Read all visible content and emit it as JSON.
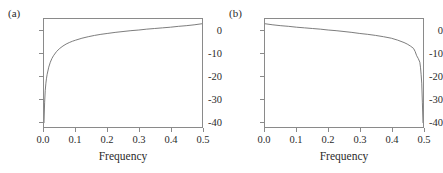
{
  "figure": {
    "background_color": "#ffffff",
    "axis_color": "#8a8a8a",
    "curve_color": "#6e6e6e",
    "text_color": "#2b2b2b"
  },
  "panels": [
    {
      "label": "(a)",
      "xlabel": "Frequency",
      "xticks": [
        "0.0",
        "0.1",
        "0.2",
        "0.3",
        "0.4",
        "0.5"
      ],
      "yticks": [
        "0",
        "-10",
        "-20",
        "-30",
        "-40"
      ]
    },
    {
      "label": "(b)",
      "xlabel": "Frequency",
      "xticks": [
        "0.0",
        "0.1",
        "0.2",
        "0.3",
        "0.4",
        "0.5"
      ],
      "yticks": [
        "0",
        "-10",
        "-20",
        "-30",
        "-40"
      ]
    }
  ],
  "chart_data": [
    {
      "type": "line",
      "title": "(a)",
      "xlabel": "Frequency",
      "ylabel": "",
      "xlim": [
        0.0,
        0.5
      ],
      "ylim": [
        -45,
        5
      ],
      "xticks": [
        0.0,
        0.1,
        0.2,
        0.3,
        0.4,
        0.5
      ],
      "yticks": [
        0,
        -10,
        -20,
        -30,
        -40
      ],
      "grid": false,
      "legend": "none",
      "series": [
        {
          "name": "spectrum-a",
          "x": [
            0.0,
            0.002,
            0.004,
            0.006,
            0.008,
            0.01,
            0.015,
            0.02,
            0.025,
            0.03,
            0.04,
            0.05,
            0.06,
            0.07,
            0.08,
            0.09,
            0.1,
            0.12,
            0.14,
            0.16,
            0.18,
            0.2,
            0.225,
            0.25,
            0.275,
            0.3,
            0.325,
            0.35,
            0.375,
            0.4,
            0.425,
            0.45,
            0.475,
            0.5
          ],
          "y": [
            -43.0,
            -33.5,
            -28.0,
            -24.7,
            -22.4,
            -20.6,
            -17.3,
            -15.0,
            -13.3,
            -12.0,
            -10.0,
            -8.6,
            -7.5,
            -6.6,
            -5.9,
            -5.3,
            -4.8,
            -3.9,
            -3.2,
            -2.6,
            -2.1,
            -1.7,
            -1.2,
            -0.8,
            -0.4,
            -0.1,
            0.3,
            0.6,
            0.9,
            1.2,
            1.6,
            1.9,
            2.3,
            2.8
          ]
        }
      ]
    },
    {
      "type": "line",
      "title": "(b)",
      "xlabel": "Frequency",
      "ylabel": "",
      "xlim": [
        0.0,
        0.5
      ],
      "ylim": [
        -45,
        5
      ],
      "xticks": [
        0.0,
        0.1,
        0.2,
        0.3,
        0.4,
        0.5
      ],
      "yticks": [
        0,
        -10,
        -20,
        -30,
        -40
      ],
      "grid": false,
      "legend": "none",
      "series": [
        {
          "name": "spectrum-b",
          "x": [
            0.0,
            0.025,
            0.05,
            0.075,
            0.1,
            0.125,
            0.15,
            0.175,
            0.2,
            0.225,
            0.25,
            0.275,
            0.3,
            0.325,
            0.35,
            0.375,
            0.4,
            0.42,
            0.44,
            0.45,
            0.46,
            0.47,
            0.475,
            0.48,
            0.485,
            0.49,
            0.492,
            0.494,
            0.496,
            0.498,
            0.5
          ],
          "y": [
            2.8,
            2.3,
            1.9,
            1.6,
            1.2,
            0.9,
            0.6,
            0.3,
            -0.1,
            -0.4,
            -0.8,
            -1.2,
            -1.7,
            -2.1,
            -2.6,
            -3.2,
            -3.9,
            -4.8,
            -5.9,
            -6.6,
            -7.5,
            -8.6,
            -10.0,
            -12.0,
            -13.3,
            -15.0,
            -17.3,
            -20.6,
            -24.7,
            -33.5,
            -43.0
          ]
        }
      ]
    }
  ]
}
